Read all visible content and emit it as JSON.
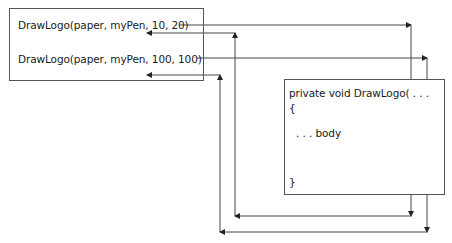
{
  "caller_box": {
    "call_1": "DrawLogo(paper, myPen, 10, 20)",
    "call_2": "DrawLogo(paper, myPen, 100, 100)"
  },
  "method_box": {
    "signature": "private void DrawLogo( . . .",
    "open_brace": "{",
    "body": ". . . body",
    "close_brace": "}"
  },
  "arrows": [
    {
      "name": "call-1-to-method",
      "from": "call_1",
      "to": "method"
    },
    {
      "name": "return-1-to-caller",
      "from": "method",
      "to": "after call_1"
    },
    {
      "name": "call-2-to-method",
      "from": "call_2",
      "to": "method"
    },
    {
      "name": "return-2-to-caller",
      "from": "method",
      "to": "after call_2"
    }
  ],
  "colors": {
    "line": "#444444",
    "text": "#1a1a1a"
  }
}
